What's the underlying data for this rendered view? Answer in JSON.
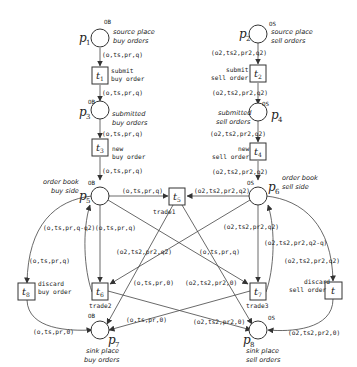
{
  "places": {
    "p1": {
      "name": "p",
      "sub": "1",
      "type": "OB",
      "desc1": "source place",
      "desc2": "buy orders"
    },
    "p2": {
      "name": "p",
      "sub": "2",
      "type": "OS",
      "desc1": "source place",
      "desc2": "sell orders"
    },
    "p3": {
      "name": "p",
      "sub": "3",
      "type": "OB",
      "desc1": "submitted",
      "desc2": "buy orders"
    },
    "p4": {
      "name": "p",
      "sub": "4",
      "type": "OS",
      "desc1": "submitted",
      "desc2": "sell orders"
    },
    "p5": {
      "name": "p",
      "sub": "5",
      "type": "OB",
      "desc1": "order book",
      "desc2": "buy side"
    },
    "p6": {
      "name": "p",
      "sub": "6",
      "type": "OS",
      "desc1": "order book",
      "desc2": "sell side"
    },
    "p7": {
      "name": "p",
      "sub": "7",
      "type": "OB",
      "desc1": "sink place",
      "desc2": "buy orders"
    },
    "p8": {
      "name": "p",
      "sub": "8",
      "type": "OS",
      "desc1": "sink place",
      "desc2": "sell orders"
    }
  },
  "transitions": {
    "t1": {
      "name": "t",
      "sub": "1",
      "desc1": "submit",
      "desc2": "buy order"
    },
    "t2": {
      "name": "t",
      "sub": "2",
      "desc1": "submit",
      "desc2": "sell order"
    },
    "t3": {
      "name": "t",
      "sub": "3",
      "desc1": "new",
      "desc2": "buy order"
    },
    "t4": {
      "name": "t",
      "sub": "4",
      "desc1": "new",
      "desc2": "sell order"
    },
    "t5": {
      "name": "t",
      "sub": "5",
      "desc1": "trade1"
    },
    "t6": {
      "name": "t",
      "sub": "6",
      "desc1": "trade2"
    },
    "t7": {
      "name": "t",
      "sub": "7",
      "desc1": "trade3"
    },
    "t8": {
      "name": "t",
      "sub": "8",
      "desc1": "discard",
      "desc2": "buy order"
    },
    "t9": {
      "name": "t",
      "sub": "",
      "desc1": "discard",
      "desc2": "sell order"
    }
  },
  "arcs": {
    "p1_t1": "(o,ts,pr,q)",
    "t1_p3": "(o,ts,pr,q)",
    "p3_t3": "(o,ts,pr,q)",
    "t3_p5": "(o,ts,pr,q)",
    "p2_t2": "(o2,ts2,pr2,q2)",
    "t2_p4": "(o2,ts2,pr2,q2)",
    "p4_t4": "(o2,ts2,pr2,q2)",
    "t4_p6": "(o2,ts2,pr2,q2)",
    "p5_t5": "(o,ts,pr,q)",
    "p6_t5": "(o2,ts2,pr2,q2)",
    "t6_p5": "(o,ts,pr,q-q2)",
    "p5_t6": "(o,ts,pr,q)",
    "p5_t8": "(o,ts,pr,q)",
    "p6_t6": "(o2,ts2,pr2,q2)",
    "p5_t7": "(o,ts,pr,q)",
    "p6_t7": "(o2,ts2,pr2,q2)",
    "t7_p6": "(o2,ts2,pr2,q2-q)",
    "p6_t9": "(o2,ts2,pr2,q2)",
    "t6_p8": "(o2,ts2,pr2,0)",
    "t7_p7": "(o,ts,pr,0)",
    "t6_p7_lbl": "(o,ts,pr,0)",
    "t7_p8_lbl": "(o2,ts2,pr2,0)",
    "t8_p7": "(o,ts,pr,0)",
    "t9_p8": "(o2,ts2,pr2,0)"
  }
}
